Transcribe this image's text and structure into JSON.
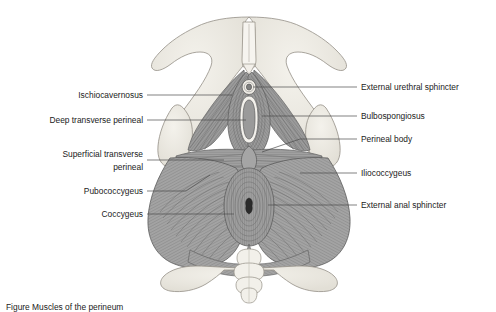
{
  "figure": {
    "view": "inferior view of the female perineum and pelvic floor",
    "background_color": "#ffffff",
    "ink_color": "#1b1b1b",
    "leader_color": "#4a4a4a"
  },
  "labels_left": [
    {
      "id": "ischiocavernosus",
      "text": "Ischiocavernosus",
      "text_x": 143,
      "text_y": 98,
      "leader": "M147,95 L232,95"
    },
    {
      "id": "deep-transverse-perineal",
      "text": "Deep transverse perineal",
      "text_x": 143,
      "text_y": 123,
      "leader": "M147,120 L246,120"
    },
    {
      "id": "superficial-transverse-perineal-line1",
      "text": "Superficial transverse",
      "text_x": 143,
      "text_y": 153,
      "leader": "M147,160 L224,160"
    },
    {
      "id": "superficial-transverse-perineal-line2",
      "text": "perineal",
      "text_x": 143,
      "text_y": 166,
      "leader": ""
    },
    {
      "id": "pubococcygeus",
      "text": "Pubococcygeus",
      "text_x": 143,
      "text_y": 194,
      "leader": "M147,191 L186,191 L210,175"
    },
    {
      "id": "coccygeus",
      "text": "Coccygeus",
      "text_x": 143,
      "text_y": 217,
      "leader": "M147,214 L234,214"
    }
  ],
  "labels_right": [
    {
      "id": "external-urethral-sphincter",
      "text": "External urethral sphincter",
      "text_x": 361,
      "text_y": 90,
      "leader": "M357,87 L253,87"
    },
    {
      "id": "bulbospongiosus",
      "text": "Bulbospongiosus",
      "text_x": 361,
      "text_y": 119,
      "leader": "M357,116 L262,116"
    },
    {
      "id": "perineal-body",
      "text": "Perineal body",
      "text_x": 361,
      "text_y": 142,
      "leader": "M357,139 L300,139 L262,152"
    },
    {
      "id": "iliococcygeus",
      "text": "Iliococcygeus",
      "text_x": 361,
      "text_y": 176,
      "leader": "M357,173 L300,173"
    },
    {
      "id": "external-anal-sphincter",
      "text": "External anal sphincter",
      "text_x": 361,
      "text_y": 208,
      "leader": "M357,205 L268,205"
    }
  ],
  "caption": {
    "text": "Figure  Muscles of the perineum",
    "clipped": true,
    "text_x": 6,
    "text_y": 308
  },
  "palette": {
    "bone_fill": "#edeae3",
    "bone_edge": "#9a958c",
    "muscle_fill": "#9e9e9e",
    "muscle_fill_dark": "#8a8a8a",
    "muscle_fill_light": "#b4b4b4",
    "fiber_stroke": "#6f6f6f",
    "outline": "#555555",
    "orifice_fill": "#8e8e8e",
    "anus_fill": "#2b2b2b"
  }
}
